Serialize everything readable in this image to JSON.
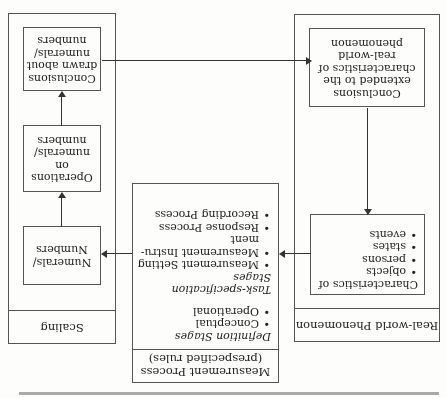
{
  "rotation_deg": 180,
  "real_world": {
    "title": "Real-world Phenomenon",
    "characteristics_heading": "Characteristics of",
    "characteristics": [
      "objects",
      "persons",
      "states",
      "events"
    ],
    "conclusions_extended": "Conclusions extended to the characteristics of real-world phenomenon"
  },
  "measurement": {
    "title_line1": "Measurement Process",
    "title_line2": "(prespecified rules)",
    "definition_heading": "Definition Stages",
    "definition_items": [
      "Conceptual",
      "Operational"
    ],
    "task_heading": "Task-specification Stages",
    "task_items": [
      "Measurement Setting",
      "Measurement Instru-ment",
      "Response Process",
      "Recording Process"
    ]
  },
  "scaling": {
    "title": "Scaling",
    "numerals": "Numerals/ Numbers",
    "operations": "Operations on numerals/ numbers",
    "conclusions_drawn": "Conclusions drawn about numerals/ numbers"
  }
}
